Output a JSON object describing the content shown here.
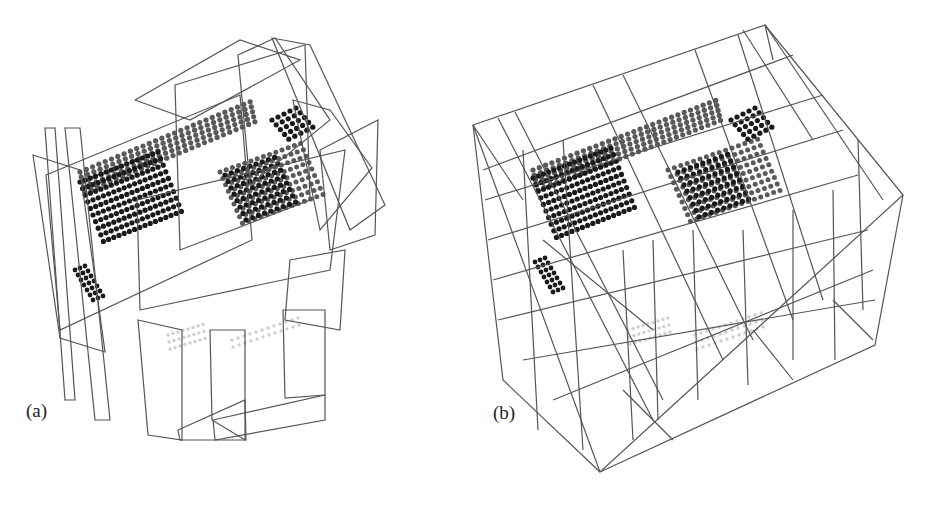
{
  "figure": {
    "panels": [
      {
        "id": "a",
        "label": "(a)",
        "description": "Point cloud of roof/structure with randomly oriented rectangular wireframe planes"
      },
      {
        "id": "b",
        "label": "(b)",
        "description": "Point cloud of same structure enclosed in axis-aligned subdivided wireframe boxes"
      }
    ],
    "colors": {
      "background": "#ffffff",
      "wire": "#555555",
      "point_dark": "#1a1a1a",
      "point_mid": "#5a5a5a",
      "point_light": "#cfcfcf"
    }
  }
}
